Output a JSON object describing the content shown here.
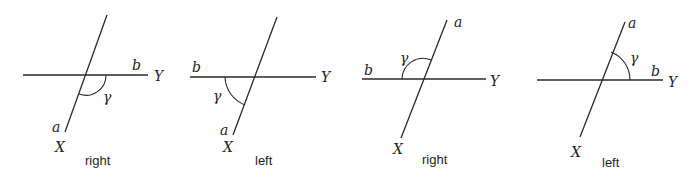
{
  "figure": {
    "panels": [
      {
        "caption": "right",
        "labels": {
          "a": "a",
          "b": "b",
          "X": "X",
          "Y": "Y",
          "gamma": "γ"
        },
        "angle_position": "below-right"
      },
      {
        "caption": "left",
        "labels": {
          "a": "a",
          "b": "b",
          "X": "X",
          "Y": "Y",
          "gamma": "γ"
        },
        "angle_position": "below-left"
      },
      {
        "caption": "right",
        "labels": {
          "a": "a",
          "b": "b",
          "X": "X",
          "Y": "Y",
          "gamma": "γ"
        },
        "angle_position": "above-left"
      },
      {
        "caption": "left",
        "labels": {
          "a": "a",
          "b": "b",
          "X": "X",
          "Y": "Y",
          "gamma": "γ"
        },
        "angle_position": "above-right"
      }
    ]
  }
}
